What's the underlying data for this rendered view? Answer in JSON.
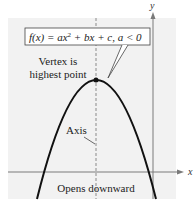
{
  "diagram": {
    "function_label": {
      "prefix": "f(x) = ax",
      "exponent": "2",
      "suffix": " + bx + c, a < 0"
    },
    "annotations": {
      "vertex_line1": "Vertex is",
      "vertex_line2": "highest point",
      "axis": "Axis",
      "opens": "Opens downward"
    },
    "axes": {
      "x_label": "x",
      "y_label": "y"
    },
    "colors": {
      "panel": "#f2f2f2",
      "curve": "#111111",
      "axis": "#7a7a7a",
      "dashed": "#8a8a8a",
      "text": "#222222"
    }
  }
}
